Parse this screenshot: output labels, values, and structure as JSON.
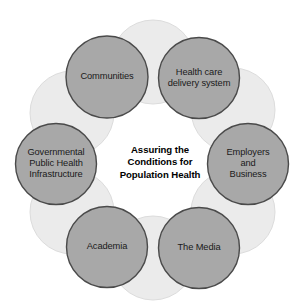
{
  "diagram": {
    "type": "circular-cluster",
    "center": {
      "text": "Assuring the\nConditions for\nPopulation Health",
      "x": 160,
      "y": 163,
      "color": "#000000",
      "bold": true
    },
    "colors": {
      "background": "#ffffff",
      "node_fill": "#a8a8a8",
      "node_stroke": "#4a4a4a",
      "halo_fill": "#ebebeb",
      "halo_stroke": "#dcdcdc",
      "label_text": "#1a1a1a"
    },
    "nodes": [
      {
        "id": "communities",
        "label": "Communities",
        "cx": 107,
        "cy": 77,
        "r": 41
      },
      {
        "id": "health-care-delivery-system",
        "label": "Health care\ndelivery system",
        "cx": 199,
        "cy": 78,
        "r": 40.5
      },
      {
        "id": "employers-and-business",
        "label": "Employers\nand Business",
        "cx": 248,
        "cy": 164,
        "r": 40.5
      },
      {
        "id": "the-media",
        "label": "The Media",
        "cx": 199,
        "cy": 248,
        "r": 40.5
      },
      {
        "id": "academia",
        "label": "Academia",
        "cx": 107,
        "cy": 247,
        "r": 40.5
      },
      {
        "id": "governmental-public-health-infrastructure",
        "label": "Governmental\nPublic Health\nInfrastructure",
        "cx": 56,
        "cy": 164,
        "r": 40.5
      }
    ],
    "halos": [
      {
        "id": "halo-top",
        "cx": 153,
        "cy": 62,
        "r": 42
      },
      {
        "id": "halo-top-right",
        "cx": 233,
        "cy": 110,
        "r": 42
      },
      {
        "id": "halo-bottom-right",
        "cx": 233,
        "cy": 212,
        "r": 42
      },
      {
        "id": "halo-bottom",
        "cx": 153,
        "cy": 258,
        "r": 42
      },
      {
        "id": "halo-bottom-left",
        "cx": 72,
        "cy": 212,
        "r": 42
      },
      {
        "id": "halo-top-left",
        "cx": 72,
        "cy": 113,
        "r": 42
      }
    ]
  }
}
